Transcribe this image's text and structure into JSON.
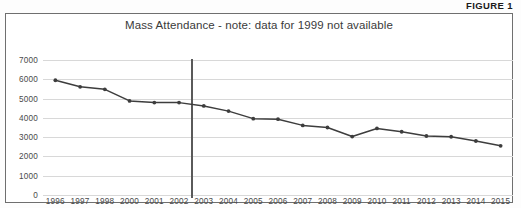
{
  "figure": {
    "label": "FIGURE 1"
  },
  "chart_data": {
    "type": "line",
    "title": "Mass Attendance - note: data for 1999 not available",
    "xlabel": "",
    "ylabel": "",
    "ylim": [
      0,
      7000
    ],
    "ytick_step": 1000,
    "yticks": [
      "0",
      "1000",
      "2000",
      "3000",
      "4000",
      "5000",
      "6000",
      "7000"
    ],
    "grid": true,
    "legend": "none",
    "note": "data for 1999 not available",
    "missing_categories": [
      "1999"
    ],
    "annotations": [
      {
        "type": "vertical-line",
        "name": "divider-line",
        "between": [
          "2002",
          "2003"
        ],
        "color": "#5a5a5a"
      }
    ],
    "categories": [
      "1996",
      "1997",
      "1998",
      "2000",
      "2001",
      "2002",
      "2003",
      "2004",
      "2005",
      "2006",
      "2007",
      "2008",
      "2009",
      "2010",
      "2011",
      "2012",
      "2013",
      "2014",
      "2015"
    ],
    "series": [
      {
        "name": "Mass Attendance",
        "color": "#3d3d3d",
        "marker": "circle",
        "values": [
          5950,
          5610,
          5480,
          4880,
          4790,
          4790,
          4620,
          4350,
          3960,
          3930,
          3610,
          3500,
          3030,
          3450,
          3280,
          3060,
          3020,
          2800,
          2550
        ]
      }
    ]
  }
}
